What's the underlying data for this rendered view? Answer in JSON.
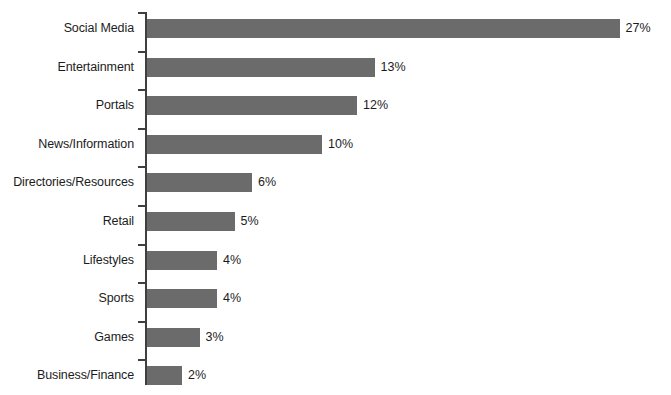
{
  "chart_data": {
    "type": "bar",
    "orientation": "horizontal",
    "title": "",
    "subtitle": "",
    "xlabel": "",
    "ylabel": "",
    "xlim": [
      0,
      27
    ],
    "grid": false,
    "legend": null,
    "value_suffix": "%",
    "categories": [
      "Social Media",
      "Entertainment",
      "Portals",
      "News/Information",
      "Directories/Resources",
      "Retail",
      "Lifestyles",
      "Sports",
      "Games",
      "Business/Finance"
    ],
    "values": [
      27,
      13,
      12,
      10,
      6,
      5,
      4,
      4,
      3,
      2
    ],
    "data_labels": [
      "27%",
      "13%",
      "12%",
      "10%",
      "6%",
      "5%",
      "4%",
      "4%",
      "3%",
      "2%"
    ],
    "colors": {
      "bar": "#6b6b6b",
      "axis": "#3f3f3f",
      "text": "#1c1c1c",
      "background": "#ffffff"
    }
  },
  "layout": {
    "axis_x": 146,
    "bar_origin_x": 147,
    "px_per_unit": 17.5,
    "first_bar_top": 19,
    "row_pitch": 38.6,
    "bar_height": 19
  }
}
